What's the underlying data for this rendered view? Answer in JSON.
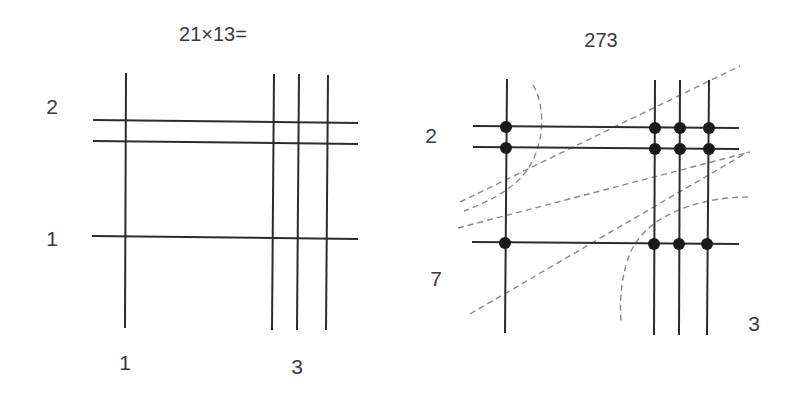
{
  "left_diagram": {
    "title": "21×13=",
    "row_labels": [
      {
        "text": "2",
        "x": 52,
        "y": 106
      },
      {
        "text": "1",
        "x": 52,
        "y": 238
      }
    ],
    "col_labels": [
      {
        "text": "1",
        "x": 125,
        "y": 362
      },
      {
        "text": "3",
        "x": 297,
        "y": 366
      }
    ],
    "title_pos": {
      "x": 213,
      "y": 34
    },
    "vertical_lines": [
      {
        "x1": 126,
        "y1": 73,
        "x2": 125,
        "y2": 328
      },
      {
        "x1": 274,
        "y1": 74,
        "x2": 272,
        "y2": 330
      },
      {
        "x1": 299,
        "y1": 74,
        "x2": 297,
        "y2": 330
      },
      {
        "x1": 328,
        "y1": 75,
        "x2": 326,
        "y2": 330
      }
    ],
    "horizontal_lines": [
      {
        "x1": 93,
        "y1": 120,
        "x2": 358,
        "y2": 123
      },
      {
        "x1": 93,
        "y1": 141,
        "x2": 358,
        "y2": 144
      },
      {
        "x1": 92,
        "y1": 236,
        "x2": 358,
        "y2": 239
      }
    ]
  },
  "right_diagram": {
    "result": "273",
    "result_pos": {
      "x": 601,
      "y": 40
    },
    "row_labels": [
      {
        "text": "2",
        "x": 431,
        "y": 135
      },
      {
        "text": "7",
        "x": 436,
        "y": 278
      }
    ],
    "col_labels": [
      {
        "text": "3",
        "x": 754,
        "y": 323
      }
    ],
    "vertical_lines": [
      {
        "x1": 507,
        "y1": 79,
        "x2": 505,
        "y2": 333
      },
      {
        "x1": 655,
        "y1": 80,
        "x2": 654,
        "y2": 335
      },
      {
        "x1": 680,
        "y1": 80,
        "x2": 679,
        "y2": 335
      },
      {
        "x1": 709,
        "y1": 80,
        "x2": 707,
        "y2": 335
      }
    ],
    "horizontal_lines": [
      {
        "x1": 473,
        "y1": 126,
        "x2": 739,
        "y2": 128
      },
      {
        "x1": 473,
        "y1": 147,
        "x2": 739,
        "y2": 149
      },
      {
        "x1": 472,
        "y1": 242,
        "x2": 739,
        "y2": 244
      }
    ],
    "intersection_dots": [
      {
        "x": 506,
        "y": 127
      },
      {
        "x": 655,
        "y": 128
      },
      {
        "x": 680,
        "y": 128
      },
      {
        "x": 709,
        "y": 128
      },
      {
        "x": 506,
        "y": 148
      },
      {
        "x": 655,
        "y": 149
      },
      {
        "x": 680,
        "y": 149
      },
      {
        "x": 709,
        "y": 149
      },
      {
        "x": 505,
        "y": 243
      },
      {
        "x": 654,
        "y": 244
      },
      {
        "x": 679,
        "y": 244
      },
      {
        "x": 707,
        "y": 244
      }
    ],
    "dashed_diagonals": [
      {
        "x1": 460,
        "y1": 202,
        "x2": 740,
        "y2": 66
      },
      {
        "x1": 458,
        "y1": 228,
        "x2": 750,
        "y2": 152
      },
      {
        "x1": 470,
        "y1": 314,
        "x2": 748,
        "y2": 152
      }
    ],
    "dashed_arcs": [
      {
        "d": "M 533 85 C 548 110, 545 160, 513 185 C 498 197, 480 205, 464 211"
      },
      {
        "d": "M 748 197 C 700 197, 640 215, 627 262 C 620 285, 620 305, 621 321"
      }
    ]
  },
  "colors": {
    "line": "#2b2b2b",
    "dashed": "#8a8a8a",
    "dot": "#1a1a1a",
    "text": "#3a3a3a",
    "background": "#ffffff"
  }
}
